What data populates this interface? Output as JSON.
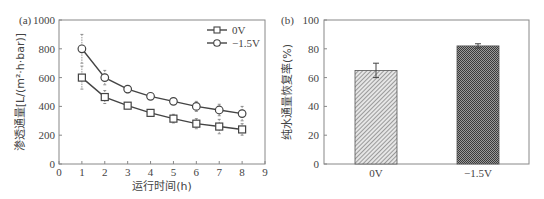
{
  "chart_data": [
    {
      "panel": "(a)",
      "type": "line",
      "title": "",
      "xlabel": "运行时间(h)",
      "ylabel": "渗透通量[L/(m²·h·bar)]",
      "xlim": [
        0,
        9
      ],
      "ylim": [
        0,
        1000
      ],
      "xticks": [
        0,
        1,
        2,
        3,
        4,
        5,
        6,
        7,
        8,
        9
      ],
      "yticks": [
        0,
        200,
        400,
        600,
        800,
        1000
      ],
      "grid": false,
      "legend_position": "upper right",
      "x": [
        1,
        2,
        3,
        4,
        5,
        6,
        7,
        8
      ],
      "series": [
        {
          "name": "0V",
          "marker": "square",
          "values": [
            600,
            465,
            405,
            355,
            315,
            280,
            260,
            240
          ],
          "errors": [
            80,
            45,
            20,
            15,
            30,
            35,
            50,
            40
          ]
        },
        {
          "name": "−1.5V",
          "marker": "circle",
          "values": [
            800,
            600,
            520,
            470,
            435,
            400,
            375,
            350
          ],
          "errors": [
            100,
            50,
            25,
            20,
            20,
            35,
            40,
            50
          ]
        }
      ]
    },
    {
      "panel": "(b)",
      "type": "bar",
      "title": "",
      "xlabel": "",
      "ylabel": "纯水通量恢复率(%)",
      "ylim": [
        0,
        100
      ],
      "yticks": [
        0,
        20,
        40,
        60,
        80,
        100
      ],
      "grid": false,
      "categories": [
        "0V",
        "−1.5V"
      ],
      "values": [
        65,
        82
      ],
      "errors": [
        5,
        1.5
      ],
      "patterns": [
        "diagonal-hatch",
        "crosshatch-dark"
      ]
    }
  ],
  "labels": {
    "panel_a": "(a)",
    "panel_b": "(b)"
  }
}
